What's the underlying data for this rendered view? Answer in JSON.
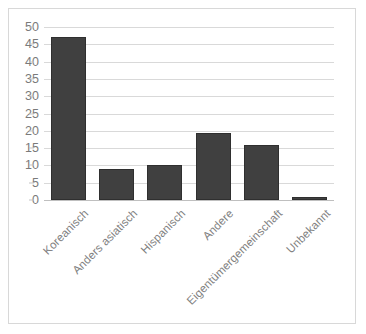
{
  "chart_data": {
    "type": "bar",
    "title": "",
    "subtitle": "",
    "xlabel": "",
    "ylabel": "",
    "categories": [
      "Koreanisch",
      "Anders asiatisch",
      "Hispanisch",
      "Andere",
      "Eigentümergemeinschaft",
      "Unbekannt"
    ],
    "values": [
      47,
      9,
      10,
      19.5,
      16,
      1
    ],
    "ylim": [
      0,
      50
    ],
    "ytick_step": 5,
    "yticks": [
      0,
      5,
      10,
      15,
      20,
      25,
      30,
      35,
      40,
      45,
      50
    ],
    "ytick_labels": [
      "0",
      "5",
      "10",
      "15",
      "20",
      "25",
      "30",
      "35",
      "40",
      "45",
      "50"
    ],
    "grid": true,
    "grid_axis": "y",
    "legend": false,
    "legend_position": "none",
    "bar_color": "#404040",
    "bar_edge_color": "#2f2f2f",
    "gridline_color": "#d9d9d9",
    "axis_label_color": "#7a7a7a",
    "category_label_color": "#808080",
    "category_label_rotation": -45,
    "frame_border_color": "#d8d8d8",
    "background_color": "#ffffff"
  }
}
